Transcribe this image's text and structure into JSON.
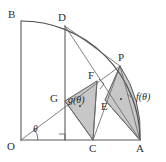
{
  "figure": {
    "type": "geometry-diagram",
    "width": 166,
    "height": 162,
    "background_color": "#ffffff",
    "stroke_color": "#5a5a5a",
    "shade_color": "#bdbdbd"
  },
  "vertices": [
    {
      "id": "B",
      "label": "B",
      "x": 21,
      "y": 21,
      "label_x": 8,
      "label_y": 9
    },
    {
      "id": "D",
      "label": "D",
      "x": 65,
      "y": 26,
      "label_x": 58,
      "label_y": 12
    },
    {
      "id": "P",
      "label": "P",
      "x": 120,
      "y": 66,
      "label_x": 118,
      "label_y": 52
    },
    {
      "id": "F",
      "label": "F",
      "x": 97,
      "y": 81,
      "label_x": 88,
      "label_y": 70
    },
    {
      "id": "E",
      "label": "E",
      "x": 105,
      "y": 100,
      "label_x": 101,
      "label_y": 101
    },
    {
      "id": "G",
      "label": "G",
      "x": 65,
      "y": 101,
      "label_x": 50,
      "label_y": 93
    },
    {
      "id": "O",
      "label": "O",
      "x": 21,
      "y": 140,
      "label_x": 7,
      "label_y": 141
    },
    {
      "id": "C",
      "label": "C",
      "x": 93,
      "y": 140,
      "label_x": 89,
      "label_y": 143
    },
    {
      "id": "A",
      "label": "A",
      "x": 140,
      "y": 140,
      "label_x": 136,
      "label_y": 143
    }
  ],
  "region_labels": [
    {
      "id": "f",
      "text": "f(θ)",
      "x": 136,
      "y": 97
    },
    {
      "id": "g",
      "text": "g(θ)",
      "x": 68,
      "y": 100
    }
  ],
  "angle_labels": [
    {
      "id": "theta",
      "text": "θ",
      "x": 33,
      "y": 127
    }
  ],
  "shaded_regions": [
    {
      "id": "g-triangle",
      "name": "triangle-G-F-C",
      "label": "g(θ)"
    },
    {
      "id": "f-region",
      "name": "curved-region-P-E-A",
      "label": "f(θ)"
    }
  ],
  "marks": {
    "right_angle_at_C_foot": true,
    "right_angle_at_F": true,
    "angle_arc_at_O": true,
    "center_dot_g": true,
    "center_dot_f": true
  }
}
